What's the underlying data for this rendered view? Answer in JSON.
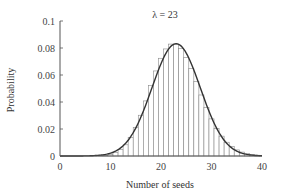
{
  "chart_data": {
    "type": "bar",
    "title": "λ = 23",
    "xlabel": "Number of seeds",
    "ylabel": "Probability",
    "xlim": [
      0,
      40
    ],
    "ylim": [
      0,
      0.1
    ],
    "xticks": [
      0,
      10,
      20,
      30,
      40
    ],
    "xtick_labels": [
      "0",
      "10",
      "20",
      "30",
      "40"
    ],
    "yticks": [
      0,
      0.02,
      0.04,
      0.06,
      0.08,
      0.1
    ],
    "ytick_labels": [
      "0",
      "0.02",
      "0.04",
      "0.06",
      "0.08",
      "0.1"
    ],
    "grid": false,
    "legend": null,
    "series": [
      {
        "name": "Poisson histogram",
        "kind": "bar",
        "x": [
          8,
          9,
          10,
          11,
          12,
          13,
          14,
          15,
          16,
          17,
          18,
          19,
          20,
          21,
          22,
          23,
          24,
          25,
          26,
          27,
          28,
          29,
          30,
          31,
          32,
          33,
          34,
          35,
          36,
          37,
          38,
          39
        ],
        "values": [
          0.0002,
          0.0005,
          0.0012,
          0.0025,
          0.0047,
          0.0083,
          0.0137,
          0.021,
          0.0302,
          0.0408,
          0.0521,
          0.063,
          0.0724,
          0.0793,
          0.0829,
          0.0829,
          0.0795,
          0.0731,
          0.0647,
          0.0551,
          0.0452,
          0.0359,
          0.0275,
          0.0204,
          0.0147,
          0.0102,
          0.0069,
          0.0045,
          0.0029,
          0.0018,
          0.0011,
          0.0006
        ]
      },
      {
        "name": "Normal approximation",
        "kind": "line",
        "mean": 23,
        "sd": 4.796
      }
    ]
  }
}
